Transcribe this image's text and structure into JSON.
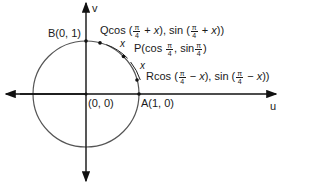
{
  "diagram": {
    "type": "unit-circle",
    "axes": {
      "horizontal": "u",
      "vertical": "v"
    },
    "points": {
      "origin": {
        "label": "(0, 0)"
      },
      "A": {
        "name": "A",
        "coords": "(1, 0)"
      },
      "B": {
        "name": "B",
        "coords": "(0, 1)"
      },
      "P": {
        "name": "P",
        "cos_text": "cos",
        "sin_text": "sin",
        "num": "π",
        "den": "4"
      },
      "Q": {
        "name": "Q",
        "cos_text": "cos (",
        "plus": " + ",
        "var": "x",
        "sin_text": "), sin (",
        "close": "))",
        "num": "π",
        "den": "4"
      },
      "R": {
        "name": "R",
        "cos_text": "cos (",
        "minus": " − ",
        "var": "x",
        "sin_text": "), sin (",
        "close": "))",
        "num": "π",
        "den": "4"
      }
    },
    "arc_labels": [
      "x",
      "x"
    ],
    "colors": {
      "circle": "#555555",
      "axis": "#111111",
      "text": "#1a1a1a"
    }
  }
}
